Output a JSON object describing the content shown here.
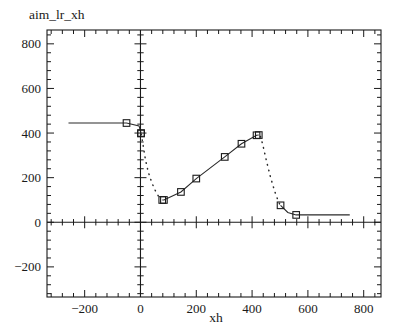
{
  "chart_data": {
    "type": "line",
    "title": "aim_lr_xh",
    "xlabel": "xh",
    "ylabel": "",
    "xlim": [
      -335,
      862
    ],
    "ylim": [
      -335,
      862
    ],
    "xticks": [
      -200,
      0,
      200,
      400,
      600,
      800
    ],
    "yticks": [
      -200,
      0,
      200,
      400,
      600,
      800
    ],
    "xticklabels": [
      "−200",
      "0",
      "200",
      "400",
      "600",
      "800"
    ],
    "yticklabels": [
      "−200",
      "0",
      "200",
      "400",
      "600",
      "800"
    ],
    "grid": false,
    "legend": null,
    "minor_ticks_per_interval": 4,
    "series": [
      {
        "name": "left-plateau",
        "style": "solid",
        "marker": "square",
        "points": [
          {
            "x": -258,
            "y": 445,
            "marker": false
          },
          {
            "x": -50,
            "y": 445,
            "marker": true
          },
          {
            "x": -5,
            "y": 432,
            "marker": false
          },
          {
            "x": 2,
            "y": 400,
            "marker": true
          },
          {
            "x": 2,
            "y": 398,
            "marker": true
          }
        ]
      },
      {
        "name": "left-dotted-descent",
        "style": "dotted",
        "marker": "none",
        "points": [
          {
            "x": 3,
            "y": 395
          },
          {
            "x": 10,
            "y": 340
          },
          {
            "x": 18,
            "y": 280
          },
          {
            "x": 28,
            "y": 225
          },
          {
            "x": 40,
            "y": 180
          },
          {
            "x": 52,
            "y": 145
          },
          {
            "x": 64,
            "y": 118
          },
          {
            "x": 76,
            "y": 102
          }
        ]
      },
      {
        "name": "rising-main",
        "style": "solid",
        "marker": "square",
        "points": [
          {
            "x": 78,
            "y": 100,
            "marker": true
          },
          {
            "x": 84,
            "y": 100,
            "marker": true
          },
          {
            "x": 145,
            "y": 136,
            "marker": true
          },
          {
            "x": 200,
            "y": 196,
            "marker": true
          },
          {
            "x": 302,
            "y": 293,
            "marker": true
          },
          {
            "x": 362,
            "y": 352,
            "marker": true
          },
          {
            "x": 416,
            "y": 390,
            "marker": true
          },
          {
            "x": 424,
            "y": 391,
            "marker": true
          }
        ]
      },
      {
        "name": "right-dotted-descent",
        "style": "dotted",
        "marker": "none",
        "points": [
          {
            "x": 430,
            "y": 385
          },
          {
            "x": 438,
            "y": 350
          },
          {
            "x": 446,
            "y": 305
          },
          {
            "x": 455,
            "y": 258
          },
          {
            "x": 464,
            "y": 212
          },
          {
            "x": 474,
            "y": 168
          },
          {
            "x": 484,
            "y": 128
          },
          {
            "x": 494,
            "y": 95
          },
          {
            "x": 500,
            "y": 78
          }
        ]
      },
      {
        "name": "right-plateau",
        "style": "solid",
        "marker": "square",
        "points": [
          {
            "x": 502,
            "y": 76,
            "marker": true
          },
          {
            "x": 528,
            "y": 44,
            "marker": false
          },
          {
            "x": 558,
            "y": 33,
            "marker": true
          },
          {
            "x": 750,
            "y": 33,
            "marker": false
          }
        ]
      }
    ]
  },
  "figure": {
    "title_text": "aim_lr_xh",
    "xaxis_title": "xh"
  }
}
